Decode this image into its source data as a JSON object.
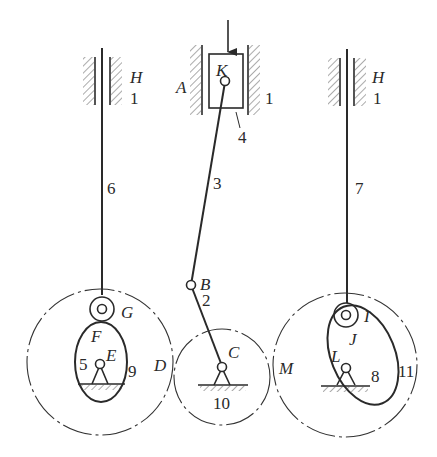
{
  "figure": {
    "colors": {
      "line": "#2a2a2a",
      "background": "#ffffff"
    }
  },
  "labels": {
    "H_left": "H",
    "one_left": "1",
    "K": "K",
    "A": "A",
    "one_mid": "1",
    "four": "4",
    "three": "3",
    "B": "B",
    "two": "2",
    "C": "C",
    "ten": "10",
    "six": "6",
    "G": "G",
    "F": "F",
    "E": "E",
    "five": "5",
    "nine": "9",
    "D": "D",
    "H_right": "H",
    "one_right": "1",
    "seven": "7",
    "I": "I",
    "J": "J",
    "L": "L",
    "eight": "8",
    "eleven": "11",
    "M": "M"
  },
  "components": {
    "left_follower": {
      "rod_label": "6",
      "roller_label": "G",
      "contact_label": "F"
    },
    "left_cam": {
      "cam_label": "5",
      "pivot_label": "E",
      "gear_label": "9"
    },
    "slider": {
      "block_label": "4",
      "pin_label": "K",
      "guide_label": "A"
    },
    "connecting_rod": {
      "label": "3",
      "joint_label": "B"
    },
    "crank": {
      "label": "2",
      "pivot_label": "C",
      "gear_label": "10"
    },
    "right_follower": {
      "rod_label": "7",
      "roller_label": "I",
      "contact_label": "J"
    },
    "right_cam": {
      "cam_label": "8",
      "pivot_label": "L",
      "gear_label": "11"
    },
    "frame": {
      "label": "1"
    },
    "contact_points": [
      "D",
      "M"
    ]
  }
}
